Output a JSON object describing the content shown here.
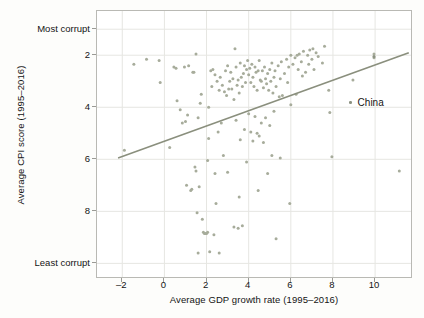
{
  "chart_data": {
    "type": "scatter",
    "title": "",
    "xlabel": "Average GDP growth rate (1995–2016)",
    "ylabel": "Average CPI score (1995–2016)",
    "xlim": [
      -3.2,
      11.8
    ],
    "ylim": [
      0.3,
      10.6
    ],
    "y_inverted": true,
    "grid": true,
    "xticks": [
      -2,
      0,
      2,
      4,
      6,
      8,
      10
    ],
    "xticklabels": [
      "–2",
      "0",
      "2",
      "4",
      "6",
      "8",
      "10"
    ],
    "yticks": [
      1.0,
      2,
      4,
      6,
      8,
      10.0
    ],
    "yticklabels": [
      "Most corrupt",
      "2",
      "4",
      "6",
      "8",
      "Least corrupt"
    ],
    "legend": {
      "position": "right-inside",
      "entries": [
        {
          "label": "China",
          "marker": "dot",
          "color": "#8c9282"
        }
      ]
    },
    "marker_color": "#a7ac9b",
    "line_color": "#8a8f7d",
    "series": [
      {
        "name": "Countries",
        "marker": "dot",
        "points": [
          [
            -1.45,
            2.35
          ],
          [
            -0.85,
            2.15
          ],
          [
            -0.25,
            2.2
          ],
          [
            -0.2,
            3.05
          ],
          [
            -1.9,
            5.65
          ],
          [
            0.25,
            5.55
          ],
          [
            0.55,
            2.5
          ],
          [
            0.6,
            3.75
          ],
          [
            0.75,
            4.1
          ],
          [
            0.85,
            4.6
          ],
          [
            1.0,
            4.55
          ],
          [
            1.05,
            7.0
          ],
          [
            1.1,
            4.3
          ],
          [
            1.25,
            7.2
          ],
          [
            1.3,
            7.15
          ],
          [
            1.35,
            2.65
          ],
          [
            1.4,
            2.65
          ],
          [
            1.45,
            6.3
          ],
          [
            1.5,
            6.45
          ],
          [
            1.5,
            1.95
          ],
          [
            1.55,
            8.05
          ],
          [
            1.6,
            4.4
          ],
          [
            1.6,
            9.6
          ],
          [
            1.65,
            7.05
          ],
          [
            1.7,
            3.85
          ],
          [
            1.75,
            3.5
          ],
          [
            1.8,
            8.3
          ],
          [
            1.85,
            8.8
          ],
          [
            1.9,
            8.85
          ],
          [
            1.95,
            8.85
          ],
          [
            2.0,
            8.85
          ],
          [
            2.05,
            8.8
          ],
          [
            2.05,
            6.05
          ],
          [
            2.1,
            4.0
          ],
          [
            2.1,
            5.2
          ],
          [
            2.15,
            9.55
          ],
          [
            2.2,
            2.6
          ],
          [
            2.25,
            3.2
          ],
          [
            2.3,
            2.55
          ],
          [
            2.35,
            8.9
          ],
          [
            2.4,
            2.75
          ],
          [
            2.4,
            6.55
          ],
          [
            2.45,
            7.7
          ],
          [
            2.5,
            3.0
          ],
          [
            2.55,
            4.95
          ],
          [
            2.6,
            3.35
          ],
          [
            2.6,
            9.6
          ],
          [
            2.65,
            2.85
          ],
          [
            2.7,
            4.6
          ],
          [
            2.75,
            3.15
          ],
          [
            2.8,
            5.85
          ],
          [
            2.85,
            3.4
          ],
          [
            2.9,
            2.6
          ],
          [
            2.95,
            3.55
          ],
          [
            3.0,
            2.4
          ],
          [
            3.0,
            6.5
          ],
          [
            3.05,
            3.3
          ],
          [
            3.1,
            3.0
          ],
          [
            3.15,
            2.65
          ],
          [
            3.2,
            3.3
          ],
          [
            3.25,
            2.9
          ],
          [
            3.3,
            3.7
          ],
          [
            3.3,
            8.6
          ],
          [
            3.35,
            1.75
          ],
          [
            3.4,
            2.45
          ],
          [
            3.4,
            4.5
          ],
          [
            3.45,
            3.15
          ],
          [
            3.5,
            2.95
          ],
          [
            3.5,
            8.65
          ],
          [
            3.55,
            3.45
          ],
          [
            3.55,
            7.45
          ],
          [
            3.6,
            2.3
          ],
          [
            3.6,
            5.25
          ],
          [
            3.65,
            2.85
          ],
          [
            3.7,
            3.2
          ],
          [
            3.7,
            8.55
          ],
          [
            3.75,
            2.7
          ],
          [
            3.8,
            2.4
          ],
          [
            3.8,
            4.85
          ],
          [
            3.85,
            3.05
          ],
          [
            3.9,
            2.55
          ],
          [
            3.9,
            6.1
          ],
          [
            3.95,
            2.2
          ],
          [
            4.0,
            2.75
          ],
          [
            4.0,
            4.25
          ],
          [
            4.05,
            2.5
          ],
          [
            4.1,
            3.05
          ],
          [
            4.1,
            4.95
          ],
          [
            4.15,
            2.35
          ],
          [
            4.2,
            2.85
          ],
          [
            4.2,
            5.3
          ],
          [
            4.25,
            3.2
          ],
          [
            4.3,
            2.45
          ],
          [
            4.3,
            4.35
          ],
          [
            4.35,
            2.65
          ],
          [
            4.4,
            3.35
          ],
          [
            4.4,
            5.0
          ],
          [
            4.45,
            2.6
          ],
          [
            4.45,
            7.2
          ],
          [
            4.5,
            2.2
          ],
          [
            4.5,
            5.1
          ],
          [
            4.55,
            2.95
          ],
          [
            4.6,
            3.0
          ],
          [
            4.6,
            4.6
          ],
          [
            4.65,
            2.6
          ],
          [
            4.7,
            3.25
          ],
          [
            4.7,
            5.35
          ],
          [
            4.75,
            2.45
          ],
          [
            4.8,
            2.9
          ],
          [
            4.8,
            4.4
          ],
          [
            4.85,
            3.1
          ],
          [
            4.9,
            2.7
          ],
          [
            4.9,
            6.55
          ],
          [
            4.95,
            3.35
          ],
          [
            5.0,
            2.55
          ],
          [
            5.0,
            4.7
          ],
          [
            5.05,
            3.0
          ],
          [
            5.1,
            2.3
          ],
          [
            5.1,
            5.85
          ],
          [
            5.15,
            3.45
          ],
          [
            5.2,
            2.85
          ],
          [
            5.2,
            4.15
          ],
          [
            5.25,
            2.6
          ],
          [
            5.3,
            3.2
          ],
          [
            5.3,
            9.05
          ],
          [
            5.4,
            2.4
          ],
          [
            5.45,
            3.6
          ],
          [
            5.5,
            2.9
          ],
          [
            5.5,
            5.95
          ],
          [
            5.55,
            2.25
          ],
          [
            5.6,
            3.55
          ],
          [
            5.7,
            2.7
          ],
          [
            5.8,
            2.15
          ],
          [
            5.85,
            3.05
          ],
          [
            5.9,
            2.45
          ],
          [
            5.95,
            7.7
          ],
          [
            6.0,
            2.0
          ],
          [
            6.0,
            3.9
          ],
          [
            6.1,
            2.35
          ],
          [
            6.2,
            2.1
          ],
          [
            6.25,
            3.5
          ],
          [
            6.3,
            2.0
          ],
          [
            6.35,
            2.55
          ],
          [
            6.4,
            1.95
          ],
          [
            6.5,
            2.25
          ],
          [
            6.55,
            2.8
          ],
          [
            6.6,
            1.85
          ],
          [
            6.7,
            2.65
          ],
          [
            6.8,
            2.0
          ],
          [
            6.85,
            2.35
          ],
          [
            6.9,
            1.8
          ],
          [
            7.0,
            2.15
          ],
          [
            7.05,
            1.75
          ],
          [
            7.1,
            2.55
          ],
          [
            7.2,
            1.9
          ],
          [
            7.3,
            2.05
          ],
          [
            7.5,
            2.3
          ],
          [
            7.6,
            1.65
          ],
          [
            7.8,
            3.35
          ],
          [
            7.85,
            4.2
          ],
          [
            7.95,
            5.9
          ],
          [
            8.95,
            2.95
          ],
          [
            9.95,
            1.95
          ],
          [
            9.95,
            2.1
          ],
          [
            11.15,
            6.45
          ],
          [
            1.15,
            2.4
          ],
          [
            0.95,
            2.45
          ],
          [
            0.45,
            2.45
          ]
        ]
      },
      {
        "name": "China",
        "marker": "dot",
        "points": [
          [
            9.95,
            2.05
          ]
        ]
      }
    ],
    "trendline": {
      "name": "Fitted line",
      "x": [
        -2.2,
        11.6
      ],
      "y": [
        5.95,
        1.9
      ],
      "color": "#8a8f7d",
      "width": 1.6
    }
  },
  "legend": {
    "china_label": "China"
  },
  "axes": {
    "x_title": "Average GDP growth rate (1995–2016)",
    "y_title": "Average CPI score (1995–2016)"
  }
}
